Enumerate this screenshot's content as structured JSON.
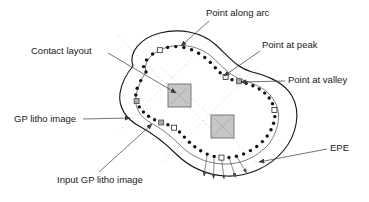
{
  "figure": {
    "kind": "technical-diagram",
    "background_color": "#ffffff"
  },
  "labels": {
    "contact_layout": "Contact layout",
    "point_along_arc": "Point along arc",
    "point_at_peak": "Point at peak",
    "point_at_valley": "Point at valley",
    "gp_litho_image": "GP litho image",
    "input_gp_litho_image": "Input GP litho image",
    "epe": "EPE"
  },
  "label_positions": {
    "contact_layout": {
      "x": 31,
      "y": 51,
      "anchor": "start"
    },
    "point_along_arc": {
      "x": 206,
      "y": 13,
      "anchor": "start"
    },
    "point_at_peak": {
      "x": 262,
      "y": 45,
      "anchor": "start"
    },
    "point_at_valley": {
      "x": 288,
      "y": 80,
      "anchor": "start"
    },
    "gp_litho_image": {
      "x": 14,
      "y": 119,
      "anchor": "start"
    },
    "input_gp_litho_image": {
      "x": 57,
      "y": 180,
      "anchor": "start"
    },
    "epe": {
      "x": 330,
      "y": 148,
      "anchor": "start"
    }
  },
  "colors": {
    "outline": "#1a1a1a",
    "inner_contour": "#2a2a2a",
    "leader": "#3a3a3a",
    "contact_fill": "#c6c6c6",
    "contact_stroke": "#6e6e6e",
    "grid": "#cfcfcf",
    "point_arc_fill": "#111111",
    "point_peak_fill": "#ffffff",
    "point_valley_fill": "#a9a9a9",
    "text": "#1a1a1a"
  },
  "geometry": {
    "outer_contour_path": "M 133 66 C 128 52, 141 38, 160 33 C 180 28, 202 32, 216 45 C 228 56, 237 68, 252 72 C 268 76, 284 82, 292 96 C 301 112, 297 134, 284 150 C 270 167, 248 177, 226 176 C 205 175, 188 166, 175 153 C 163 141, 152 133, 139 126 C 126 119, 118 107, 120 93 C 122 80, 128 72, 133 66 Z",
    "inner_contour_path": "M 146 72 C 143 61, 153 51, 168 47 C 184 43, 201 47, 212 57 C 222 66, 230 76, 243 80 C 256 84, 269 90, 275 102 C 282 115, 278 132, 268 145 C 256 158, 239 165, 222 164 C 205 163, 191 156, 181 146 C 171 136, 162 129, 151 123 C 140 117, 134 107, 136 96 C 138 86, 142 78, 146 72 Z",
    "contacts": [
      {
        "x": 168,
        "y": 84,
        "size": 23
      },
      {
        "x": 211,
        "y": 115,
        "size": 23
      }
    ],
    "grid_lines": [
      {
        "x1": 118,
        "y1": 36,
        "x2": 214,
        "y2": 132
      },
      {
        "x1": 214,
        "y1": 36,
        "x2": 118,
        "y2": 132
      },
      {
        "x1": 161,
        "y1": 67,
        "x2": 257,
        "y2": 163
      },
      {
        "x1": 257,
        "y1": 67,
        "x2": 161,
        "y2": 163
      }
    ]
  },
  "sampled_points": {
    "legend": [
      {
        "type": "arc",
        "marker": "filled-circle",
        "label": "Point along arc"
      },
      {
        "type": "peak",
        "marker": "hollow-square",
        "label": "Point at peak"
      },
      {
        "type": "valley",
        "marker": "gray-square",
        "label": "Point at valley"
      }
    ],
    "counts": {
      "arc": 44,
      "peak": 6,
      "valley": 3,
      "total": 53
    },
    "points": [
      {
        "x": 146.0,
        "y": 72.0,
        "type": "arc"
      },
      {
        "x": 143.6,
        "y": 66.6,
        "type": "arc"
      },
      {
        "x": 146.5,
        "y": 59.9,
        "type": "arc"
      },
      {
        "x": 152.6,
        "y": 54.0,
        "type": "arc"
      },
      {
        "x": 159.8,
        "y": 50.2,
        "type": "peak"
      },
      {
        "x": 167.6,
        "y": 47.4,
        "type": "arc"
      },
      {
        "x": 175.8,
        "y": 46.6,
        "type": "arc"
      },
      {
        "x": 183.9,
        "y": 47.5,
        "type": "arc"
      },
      {
        "x": 191.6,
        "y": 49.8,
        "type": "arc"
      },
      {
        "x": 198.6,
        "y": 53.2,
        "type": "arc"
      },
      {
        "x": 204.8,
        "y": 57.5,
        "type": "arc"
      },
      {
        "x": 210.3,
        "y": 62.4,
        "type": "arc"
      },
      {
        "x": 215.3,
        "y": 67.7,
        "type": "arc"
      },
      {
        "x": 220.2,
        "y": 72.8,
        "type": "arc"
      },
      {
        "x": 225.6,
        "y": 77.0,
        "type": "peak"
      },
      {
        "x": 232.0,
        "y": 79.7,
        "type": "arc"
      },
      {
        "x": 239.0,
        "y": 81.3,
        "type": "valley"
      },
      {
        "x": 246.1,
        "y": 83.3,
        "type": "arc"
      },
      {
        "x": 252.9,
        "y": 85.8,
        "type": "arc"
      },
      {
        "x": 259.2,
        "y": 89.0,
        "type": "arc"
      },
      {
        "x": 264.7,
        "y": 93.1,
        "type": "arc"
      },
      {
        "x": 269.2,
        "y": 98.0,
        "type": "arc"
      },
      {
        "x": 272.5,
        "y": 103.7,
        "type": "arc"
      },
      {
        "x": 274.4,
        "y": 110.0,
        "type": "peak"
      },
      {
        "x": 274.8,
        "y": 116.6,
        "type": "arc"
      },
      {
        "x": 273.6,
        "y": 123.3,
        "type": "arc"
      },
      {
        "x": 271.0,
        "y": 129.8,
        "type": "arc"
      },
      {
        "x": 267.2,
        "y": 136.0,
        "type": "arc"
      },
      {
        "x": 262.4,
        "y": 141.6,
        "type": "arc"
      },
      {
        "x": 256.7,
        "y": 146.5,
        "type": "arc"
      },
      {
        "x": 250.4,
        "y": 150.6,
        "type": "arc"
      },
      {
        "x": 243.6,
        "y": 153.9,
        "type": "arc"
      },
      {
        "x": 236.4,
        "y": 156.2,
        "type": "arc"
      },
      {
        "x": 229.0,
        "y": 157.5,
        "type": "arc"
      },
      {
        "x": 221.5,
        "y": 157.6,
        "type": "peak"
      },
      {
        "x": 214.2,
        "y": 156.4,
        "type": "arc"
      },
      {
        "x": 207.2,
        "y": 154.1,
        "type": "arc"
      },
      {
        "x": 200.7,
        "y": 150.8,
        "type": "arc"
      },
      {
        "x": 194.8,
        "y": 146.8,
        "type": "arc"
      },
      {
        "x": 189.4,
        "y": 142.2,
        "type": "arc"
      },
      {
        "x": 184.4,
        "y": 137.1,
        "type": "arc"
      },
      {
        "x": 179.5,
        "y": 132.0,
        "type": "arc"
      },
      {
        "x": 174.1,
        "y": 127.7,
        "type": "peak"
      },
      {
        "x": 167.9,
        "y": 124.7,
        "type": "arc"
      },
      {
        "x": 161.2,
        "y": 122.5,
        "type": "valley"
      },
      {
        "x": 154.6,
        "y": 119.8,
        "type": "arc"
      },
      {
        "x": 148.6,
        "y": 116.3,
        "type": "arc"
      },
      {
        "x": 143.4,
        "y": 112.0,
        "type": "arc"
      },
      {
        "x": 139.3,
        "y": 106.9,
        "type": "arc"
      },
      {
        "x": 136.6,
        "y": 101.1,
        "type": "valley"
      },
      {
        "x": 135.8,
        "y": 95.0,
        "type": "arc"
      },
      {
        "x": 137.2,
        "y": 88.3,
        "type": "arc"
      },
      {
        "x": 140.7,
        "y": 80.6,
        "type": "arc"
      }
    ]
  },
  "epe_measurements": {
    "description": "Edge placement error arrows from inner contour points outward to the GP litho image boundary",
    "count": 5,
    "arrows": [
      {
        "x1": 207.2,
        "y1": 154.1,
        "x2": 204.0,
        "y2": 176.0
      },
      {
        "x1": 214.2,
        "y1": 156.4,
        "x2": 213.5,
        "y2": 178.5
      },
      {
        "x1": 221.5,
        "y1": 157.6,
        "x2": 224.0,
        "y2": 178.8
      },
      {
        "x1": 229.0,
        "y1": 157.5,
        "x2": 235.5,
        "y2": 177.2
      },
      {
        "x1": 236.4,
        "y1": 156.2,
        "x2": 246.5,
        "y2": 172.8
      }
    ]
  },
  "leader_lines": [
    {
      "name": "contact-layout-leader",
      "x1": 108,
      "y1": 53,
      "x2": 176,
      "y2": 93,
      "arrow": true
    },
    {
      "name": "point-along-arc-leader",
      "x1": 209,
      "y1": 21,
      "x2": 181,
      "y2": 46,
      "arrow": true
    },
    {
      "name": "point-at-peak-leader",
      "x1": 260,
      "y1": 51,
      "x2": 224,
      "y2": 76,
      "arrow": true
    },
    {
      "name": "point-at-valley-leader",
      "x1": 285,
      "y1": 81,
      "x2": 241,
      "y2": 82,
      "arrow": true
    },
    {
      "name": "gp-litho-image-leader",
      "x1": 83,
      "y1": 119,
      "x2": 130,
      "y2": 118,
      "arrow": true
    },
    {
      "name": "input-gp-litho-image-leader",
      "x1": 99,
      "y1": 172,
      "x2": 152,
      "y2": 124,
      "arrow": true
    },
    {
      "name": "epe-leader",
      "x1": 327,
      "y1": 149,
      "x2": 259,
      "y2": 162,
      "arrow": true
    }
  ]
}
